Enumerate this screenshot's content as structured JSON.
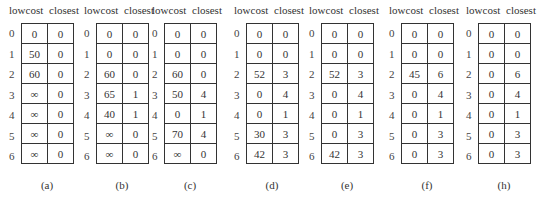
{
  "columns": [
    "lowcost",
    "closest"
  ],
  "row_indices": [
    "0",
    "1",
    "2",
    "3",
    "4",
    "5",
    "6"
  ],
  "panels": [
    {
      "caption": "(a)",
      "lowcost": [
        "0",
        "50",
        "60",
        "∞",
        "∞",
        "∞",
        "∞"
      ],
      "closest": [
        "0",
        "0",
        "0",
        "0",
        "0",
        "0",
        "0"
      ]
    },
    {
      "caption": "(b)",
      "lowcost": [
        "0",
        "0",
        "60",
        "65",
        "40",
        "∞",
        "∞"
      ],
      "closest": [
        "0",
        "0",
        "0",
        "1",
        "1",
        "0",
        "0"
      ]
    },
    {
      "caption": "(c)",
      "lowcost": [
        "0",
        "0",
        "60",
        "50",
        "0",
        "70",
        "∞"
      ],
      "closest": [
        "0",
        "0",
        "0",
        "4",
        "1",
        "4",
        "0"
      ]
    },
    {
      "caption": "(d)",
      "lowcost": [
        "0",
        "0",
        "52",
        "0",
        "0",
        "30",
        "42"
      ],
      "closest": [
        "0",
        "0",
        "3",
        "4",
        "1",
        "3",
        "3"
      ]
    },
    {
      "caption": "(e)",
      "lowcost": [
        "0",
        "0",
        "52",
        "0",
        "0",
        "0",
        "42"
      ],
      "closest": [
        "0",
        "0",
        "3",
        "4",
        "1",
        "3",
        "3"
      ]
    },
    {
      "caption": "(f)",
      "lowcost": [
        "0",
        "0",
        "45",
        "0",
        "0",
        "0",
        "0"
      ],
      "closest": [
        "0",
        "0",
        "6",
        "4",
        "1",
        "3",
        "3"
      ]
    },
    {
      "caption": "(h)",
      "lowcost": [
        "0",
        "0",
        "0",
        "0",
        "0",
        "0",
        "0"
      ],
      "closest": [
        "0",
        "0",
        "6",
        "4",
        "1",
        "3",
        "3"
      ]
    }
  ]
}
